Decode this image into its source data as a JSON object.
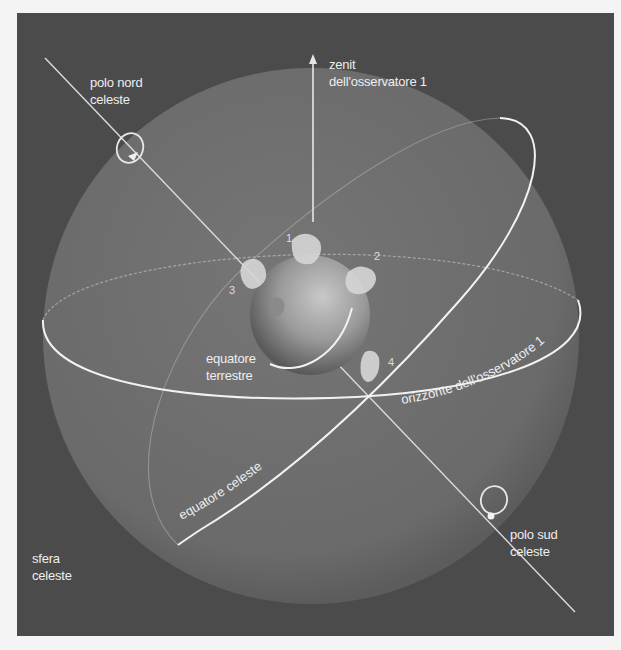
{
  "diagram": {
    "title": "sfera celeste",
    "colors": {
      "page_background": "#f4f4f4",
      "frame_background": "#4b4b4b",
      "sphere_fill": "#6e6e6e",
      "lines": "#eeeeee",
      "earth": "#9a9a9a"
    },
    "labels": {
      "north_pole": [
        "polo nord",
        "celeste"
      ],
      "zenith": [
        "zenit",
        "dell'osservatore 1"
      ],
      "earth_equator": [
        "equatore",
        "terrestre"
      ],
      "horizon": "orizzonte dell'osservatore 1",
      "celestial_equator": "equatore celeste",
      "south_pole": [
        "polo sud",
        "celeste"
      ],
      "sphere": [
        "sfera",
        "celeste"
      ]
    },
    "observers": [
      "1",
      "2",
      "3",
      "4"
    ]
  }
}
